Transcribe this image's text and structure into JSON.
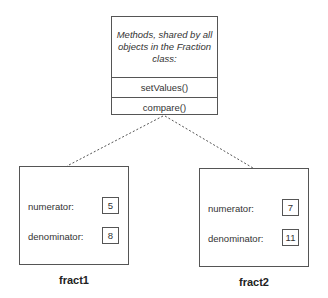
{
  "class_box": {
    "description": "Methods, shared by all objects in the Fraction class:",
    "methods": [
      "setValues()",
      "compare()"
    ]
  },
  "objects": [
    {
      "name": "fract1",
      "fields": [
        {
          "label": "numerator:",
          "value": "5"
        },
        {
          "label": "denominator:",
          "value": "8"
        }
      ]
    },
    {
      "name": "fract2",
      "fields": [
        {
          "label": "numerator:",
          "value": "7"
        },
        {
          "label": "denominator:",
          "value": "11"
        }
      ]
    }
  ]
}
